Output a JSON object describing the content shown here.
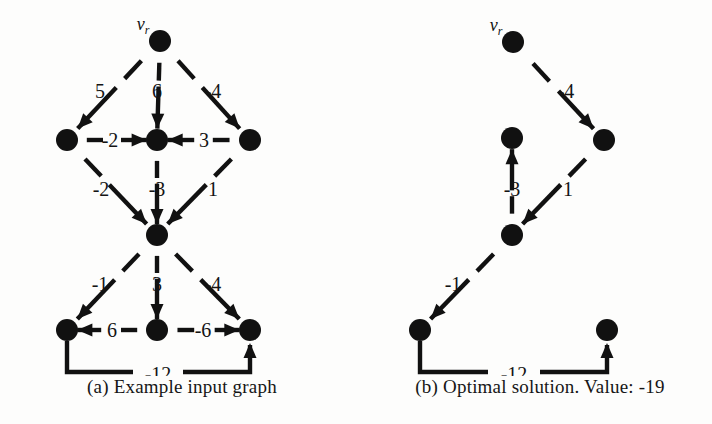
{
  "figure": {
    "width": 712,
    "height": 424,
    "background_color": "#fdfdfc",
    "ink_color": "#111111"
  },
  "panels": [
    {
      "id": "a",
      "caption": "(a) Example input graph",
      "root_label_base": "v",
      "root_label_sub": "r",
      "nodes": [
        {
          "name": "root",
          "id": "a-n0",
          "x": 160,
          "y": 41,
          "r": 11,
          "is_root": true
        },
        {
          "name": "left-mid",
          "id": "a-n1",
          "x": 67,
          "y": 140,
          "r": 11,
          "is_root": false
        },
        {
          "name": "center-mid",
          "id": "a-n2",
          "x": 157,
          "y": 140,
          "r": 11,
          "is_root": false
        },
        {
          "name": "right-mid",
          "id": "a-n3",
          "x": 250,
          "y": 140,
          "r": 11,
          "is_root": false
        },
        {
          "name": "hub",
          "id": "a-n4",
          "x": 157,
          "y": 235,
          "r": 11,
          "is_root": false
        },
        {
          "name": "left-bottom",
          "id": "a-n5",
          "x": 67,
          "y": 330,
          "r": 11,
          "is_root": false
        },
        {
          "name": "center-bottom",
          "id": "a-n6",
          "x": 157,
          "y": 330,
          "r": 11,
          "is_root": false
        },
        {
          "name": "right-bottom",
          "id": "a-n7",
          "x": 250,
          "y": 330,
          "r": 11,
          "is_root": false
        }
      ],
      "edges": [
        {
          "name": "edge-root-to-left-mid",
          "from": "a-n0",
          "to": "a-n1",
          "weight": "5",
          "label_x": 100,
          "label_y": 98,
          "gap_start": 0.2,
          "gap_end": 0.47,
          "arrow": "end"
        },
        {
          "name": "edge-root-to-center-mid",
          "from": "a-n0",
          "to": "a-n2",
          "weight": "6",
          "label_x": 157,
          "label_y": 98,
          "gap_start": 0.22,
          "gap_end": 0.46,
          "arrow": "end"
        },
        {
          "name": "edge-root-to-right-mid",
          "from": "a-n0",
          "to": "a-n3",
          "weight": "-4",
          "label_x": 213,
          "label_y": 98,
          "gap_start": 0.2,
          "gap_end": 0.47,
          "arrow": "end"
        },
        {
          "name": "edge-left-mid-to-center-mid",
          "from": "a-n1",
          "to": "a-n2",
          "weight": "-2",
          "label_x": 110,
          "label_y": 147,
          "gap_start": 0.22,
          "gap_end": 0.6,
          "arrow": "end"
        },
        {
          "name": "edge-right-mid-to-center-mid",
          "from": "a-n3",
          "to": "a-n2",
          "weight": "3",
          "label_x": 204,
          "label_y": 147,
          "gap_start": 0.22,
          "gap_end": 0.6,
          "arrow": "end"
        },
        {
          "name": "edge-left-mid-to-hub",
          "from": "a-n1",
          "to": "a-n4",
          "weight": "-2",
          "label_x": 101,
          "label_y": 196,
          "gap_start": 0.2,
          "gap_end": 0.47,
          "arrow": "end"
        },
        {
          "name": "edge-center-mid-to-hub",
          "from": "a-n2",
          "to": "a-n4",
          "weight": "-3",
          "label_x": 157,
          "label_y": 196,
          "gap_start": 0.22,
          "gap_end": 0.46,
          "arrow": "end"
        },
        {
          "name": "edge-right-mid-to-hub",
          "from": "a-n3",
          "to": "a-n4",
          "weight": "1",
          "label_x": 213,
          "label_y": 196,
          "gap_start": 0.2,
          "gap_end": 0.47,
          "arrow": "end"
        },
        {
          "name": "edge-hub-to-left-bottom",
          "from": "a-n4",
          "to": "a-n5",
          "weight": "-1",
          "label_x": 100,
          "label_y": 291,
          "gap_start": 0.2,
          "gap_end": 0.47,
          "arrow": "end"
        },
        {
          "name": "edge-hub-to-center-bottom",
          "from": "a-n4",
          "to": "a-n6",
          "weight": "3",
          "label_x": 157,
          "label_y": 291,
          "gap_start": 0.22,
          "gap_end": 0.46,
          "arrow": "end"
        },
        {
          "name": "edge-hub-to-right-bottom",
          "from": "a-n4",
          "to": "a-n7",
          "weight": "-4",
          "label_x": 213,
          "label_y": 291,
          "gap_start": 0.2,
          "gap_end": 0.47,
          "arrow": "end"
        },
        {
          "name": "edge-center-bottom-to-left-bottom",
          "from": "a-n6",
          "to": "a-n5",
          "weight": "6",
          "label_x": 112,
          "label_y": 337,
          "gap_start": 0.22,
          "gap_end": 0.62,
          "arrow": "end"
        },
        {
          "name": "edge-center-bottom-to-right-bottom",
          "from": "a-n6",
          "to": "a-n7",
          "weight": "-6",
          "label_x": 203,
          "label_y": 337,
          "gap_start": 0.22,
          "gap_end": 0.62,
          "arrow": "end"
        }
      ],
      "routed_edges": [
        {
          "name": "edge-left-bottom-to-right-bottom",
          "weight": "-12",
          "label_x": 158,
          "label_y": 381,
          "points": "67,341 67,372 133,372",
          "points_tail": "183,372 250,372 250,345",
          "arrow_x": 250,
          "arrow_y": 343,
          "arrow_dir": "up"
        }
      ]
    },
    {
      "id": "b",
      "caption": "(b) Optimal solution. Value: -19",
      "root_label_base": "v",
      "root_label_sub": "r",
      "nodes": [
        {
          "name": "root",
          "id": "b-n0",
          "x": 157,
          "y": 42,
          "r": 11,
          "is_root": true
        },
        {
          "name": "isolated-mid",
          "id": "b-n1",
          "x": 156,
          "y": 138,
          "r": 11,
          "is_root": false
        },
        {
          "name": "right-mid",
          "id": "b-n2",
          "x": 248,
          "y": 140,
          "r": 11,
          "is_root": false
        },
        {
          "name": "hub",
          "id": "b-n3",
          "x": 156,
          "y": 235,
          "r": 11,
          "is_root": false
        },
        {
          "name": "left-bottom",
          "id": "b-n4",
          "x": 64,
          "y": 330,
          "r": 11,
          "is_root": false
        },
        {
          "name": "right-bottom",
          "id": "b-n5",
          "x": 251,
          "y": 330,
          "r": 11,
          "is_root": false
        }
      ],
      "edges": [
        {
          "name": "edge-root-to-right-mid",
          "from": "b-n0",
          "to": "b-n2",
          "weight": "-4",
          "label_x": 210,
          "label_y": 98,
          "gap_start": 0.22,
          "gap_end": 0.5,
          "arrow": "end"
        },
        {
          "name": "edge-hub-to-isolated-mid",
          "from": "b-n3",
          "to": "b-n1",
          "weight": "-3",
          "label_x": 156,
          "label_y": 196,
          "gap_start": 0.22,
          "gap_end": 0.46,
          "arrow": "end"
        },
        {
          "name": "edge-right-mid-to-hub",
          "from": "b-n2",
          "to": "b-n3",
          "weight": "1",
          "label_x": 212,
          "label_y": 196,
          "gap_start": 0.2,
          "gap_end": 0.47,
          "arrow": "end"
        },
        {
          "name": "edge-hub-to-left-bottom",
          "from": "b-n3",
          "to": "b-n4",
          "weight": "-1",
          "label_x": 97,
          "label_y": 291,
          "gap_start": 0.2,
          "gap_end": 0.47,
          "arrow": "end"
        }
      ],
      "routed_edges": [
        {
          "name": "edge-left-bottom-to-right-bottom",
          "weight": "-12",
          "label_x": 158,
          "label_y": 381,
          "points": "64,341 64,372 132,372",
          "points_tail": "184,372 251,372 251,345",
          "arrow_x": 251,
          "arrow_y": 343,
          "arrow_dir": "up"
        }
      ]
    }
  ],
  "chart_data": {
    "type": "diagram",
    "graphs": [
      {
        "name": "(a) Example input graph",
        "root": "v_r",
        "node_count": 8,
        "edges": [
          {
            "from": "v_r",
            "to": "left-mid",
            "weight": 5
          },
          {
            "from": "v_r",
            "to": "center-mid",
            "weight": 6
          },
          {
            "from": "v_r",
            "to": "right-mid",
            "weight": -4
          },
          {
            "from": "left-mid",
            "to": "center-mid",
            "weight": -2
          },
          {
            "from": "right-mid",
            "to": "center-mid",
            "weight": 3
          },
          {
            "from": "left-mid",
            "to": "hub",
            "weight": -2
          },
          {
            "from": "center-mid",
            "to": "hub",
            "weight": -3
          },
          {
            "from": "right-mid",
            "to": "hub",
            "weight": 1
          },
          {
            "from": "hub",
            "to": "left-bottom",
            "weight": -1
          },
          {
            "from": "hub",
            "to": "center-bottom",
            "weight": 3
          },
          {
            "from": "hub",
            "to": "right-bottom",
            "weight": -4
          },
          {
            "from": "center-bottom",
            "to": "left-bottom",
            "weight": 6
          },
          {
            "from": "center-bottom",
            "to": "right-bottom",
            "weight": -6
          },
          {
            "from": "left-bottom",
            "to": "right-bottom",
            "weight": -12
          }
        ]
      },
      {
        "name": "(b) Optimal solution. Value: -19",
        "root": "v_r",
        "node_count": 6,
        "total_value": -19,
        "edges": [
          {
            "from": "v_r",
            "to": "right-mid",
            "weight": -4
          },
          {
            "from": "right-mid",
            "to": "hub",
            "weight": 1
          },
          {
            "from": "hub",
            "to": "isolated-mid",
            "weight": -3
          },
          {
            "from": "hub",
            "to": "left-bottom",
            "weight": -1
          },
          {
            "from": "left-bottom",
            "to": "right-bottom",
            "weight": -12
          }
        ]
      }
    ]
  }
}
